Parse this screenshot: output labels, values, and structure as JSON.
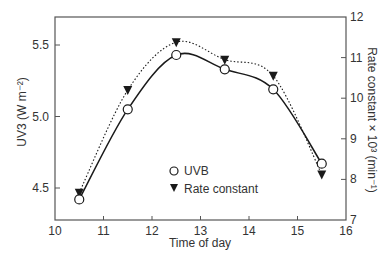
{
  "chart_data": {
    "type": "line",
    "title": "",
    "xlabel": "Time of day",
    "ylabel": "UV3 (W m⁻²)",
    "ylabel_right": "Rate constant × 10³ (min⁻¹)",
    "xlim": [
      10,
      16
    ],
    "ylim": [
      4.28,
      5.7
    ],
    "ylim_right": [
      7,
      12
    ],
    "x_ticks": [
      10,
      11,
      12,
      13,
      14,
      15,
      16
    ],
    "y_ticks": [
      4.5,
      5.0,
      5.5
    ],
    "y_tick_labels": [
      "4.5",
      "5.0",
      "5.5"
    ],
    "y_ticks_right": [
      7,
      8,
      9,
      10,
      11,
      12
    ],
    "grid": false,
    "legend_position": "lower center (inside)",
    "x": [
      10.5,
      11.5,
      12.5,
      13.5,
      14.5,
      15.5
    ],
    "series": [
      {
        "name": "UVB",
        "axis": "left",
        "marker": "open-circle",
        "line": "solid",
        "values": [
          4.42,
          5.05,
          5.43,
          5.33,
          5.19,
          4.67
        ]
      },
      {
        "name": "Rate constant",
        "axis": "right",
        "marker": "filled-down-triangle",
        "line": "dotted",
        "values": [
          7.67,
          10.2,
          11.38,
          10.95,
          10.55,
          8.12
        ]
      }
    ]
  },
  "legend": {
    "items": [
      "UVB",
      "Rate constant"
    ]
  },
  "colors": {
    "axis": "#555555",
    "line": "#1a1a1a",
    "text": "#333333"
  }
}
